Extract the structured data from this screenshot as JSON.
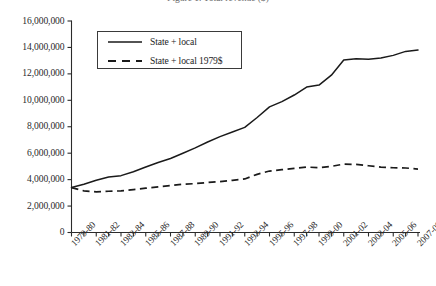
{
  "chart_data": {
    "type": "line",
    "title": "Figure 1. Total revenue ($)",
    "xlabel": "",
    "ylabel": "",
    "ylim": [
      0,
      16000000
    ],
    "ytick_labels": [
      "16,000,000",
      "14,000,000",
      "12,000,000",
      "10,000,000",
      "8,000,000",
      "6,000,000",
      "4,000,000",
      "2,000,000",
      "0"
    ],
    "ytick_values": [
      16000000,
      14000000,
      12000000,
      10000000,
      8000000,
      6000000,
      4000000,
      2000000,
      0
    ],
    "grid": false,
    "legend_position": "upper-left",
    "categories": [
      "1979-80",
      "1980-81",
      "1981-82",
      "1982-83",
      "1983-84",
      "1984-85",
      "1985-86",
      "1986-87",
      "1987-88",
      "1988-89",
      "1989-90",
      "1990-91",
      "1991-92",
      "1992-93",
      "1993-94",
      "1994-95",
      "1995-96",
      "1996-97",
      "1997-98",
      "1998-99",
      "1999-00",
      "2000-01",
      "2001-02",
      "2002-03",
      "2003-04",
      "2004-05",
      "2005-06",
      "2006-07",
      "2007-08"
    ],
    "xtick_labels": [
      "1979-80",
      "1981-82",
      "1983-84",
      "1985-86",
      "1987-88",
      "1989-90",
      "1991-92",
      "1993-94",
      "1995-96",
      "1997-98",
      "1999-00",
      "2001-02",
      "2003-04",
      "2005-06",
      "2007-08"
    ],
    "series": [
      {
        "name": "State + local",
        "style": "solid",
        "color": "#1a1a1a",
        "values": [
          3400000,
          3650000,
          3950000,
          4200000,
          4300000,
          4600000,
          4950000,
          5300000,
          5600000,
          6000000,
          6400000,
          6850000,
          7250000,
          7600000,
          7950000,
          8700000,
          9500000,
          9900000,
          10400000,
          11000000,
          11150000,
          11900000,
          13050000,
          13150000,
          13100000,
          13200000,
          13400000,
          13700000,
          13800000
        ]
      },
      {
        "name": "State + local 1979$",
        "style": "dashed",
        "color": "#1a1a1a",
        "values": [
          3400000,
          3150000,
          3080000,
          3120000,
          3150000,
          3250000,
          3350000,
          3450000,
          3550000,
          3650000,
          3700000,
          3780000,
          3850000,
          3950000,
          4050000,
          4400000,
          4650000,
          4750000,
          4850000,
          4950000,
          4900000,
          5000000,
          5180000,
          5150000,
          5050000,
          4950000,
          4900000,
          4880000,
          4800000
        ]
      }
    ]
  },
  "legend": {
    "items": [
      {
        "label": "State + local"
      },
      {
        "label": "State + local 1979$"
      }
    ]
  }
}
